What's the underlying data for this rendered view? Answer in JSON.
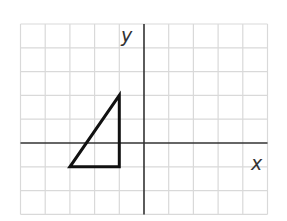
{
  "diagram": {
    "type": "coordinate-plane",
    "grid": {
      "x_min": -5,
      "x_max": 5,
      "y_min": -3,
      "y_max": 5,
      "origin_px": [
        144,
        143
      ],
      "cell_w_px": 24.7,
      "cell_h_px": 23.8,
      "line_color": "#d9d9d9",
      "axis_color": "#333333"
    },
    "axes": {
      "x_label": "x",
      "y_label": "y"
    },
    "shapes": [
      {
        "name": "right-triangle",
        "vertices": [
          [
            -1,
            2
          ],
          [
            -1,
            -1
          ],
          [
            -3,
            -1
          ]
        ],
        "stroke": "#111111",
        "stroke_width": 3
      }
    ]
  }
}
